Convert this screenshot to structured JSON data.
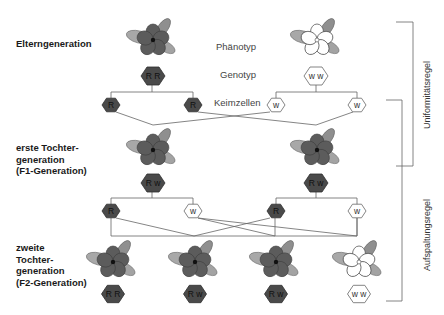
{
  "labels": {
    "parents": "Elterngeneration",
    "f1": "erste Tochter-\ngeneration\n(F1-Generation)",
    "f2": "zweite\nTochter-\ngeneration\n(F2-Generation)",
    "phenotype": "Phänotyp",
    "genotype": "Genotyp",
    "gametes": "Keimzellen"
  },
  "rules": {
    "uniformity": "Uniformitätsregel",
    "segregation": "Aufspaltungsregel"
  },
  "colors": {
    "dominant_flower": "#5a5a5a",
    "recessive_flower": "#ffffff",
    "leaf": "#9a9a9a",
    "hex_dark": "#4a4a4a",
    "hex_light": "#ffffff",
    "line": "#555555"
  },
  "parents": [
    {
      "phenotype": "dark",
      "genotype": "R R",
      "gametes": [
        "R",
        "R"
      ]
    },
    {
      "phenotype": "white",
      "genotype": "w w",
      "gametes": [
        "w",
        "w"
      ]
    }
  ],
  "f1": [
    {
      "phenotype": "dark",
      "genotype": "R w",
      "gametes": [
        "R",
        "w"
      ]
    },
    {
      "phenotype": "dark",
      "genotype": "R w",
      "gametes": [
        "R",
        "w"
      ]
    }
  ],
  "f2": [
    {
      "phenotype": "dark",
      "genotype": "R R"
    },
    {
      "phenotype": "dark",
      "genotype": "R w"
    },
    {
      "phenotype": "dark",
      "genotype": "R w"
    },
    {
      "phenotype": "white",
      "genotype": "w w"
    }
  ]
}
